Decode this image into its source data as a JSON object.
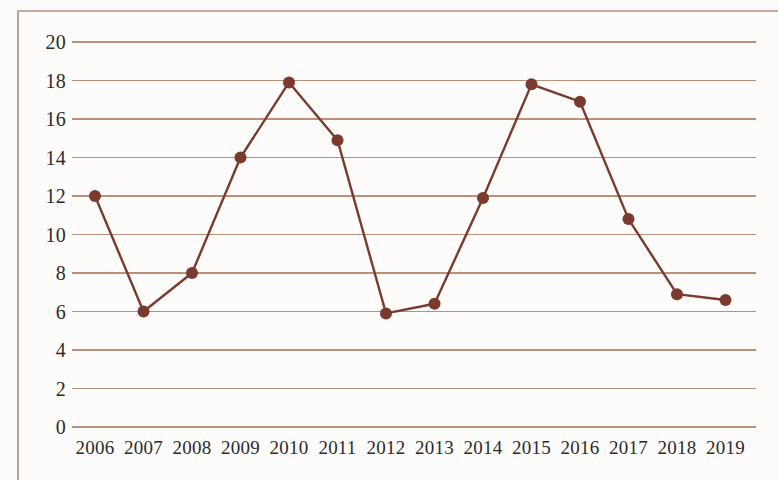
{
  "chart_data": {
    "type": "line",
    "title": "",
    "subtitle": "",
    "xlabel": "",
    "ylabel": "",
    "categories": [
      "2006",
      "2007",
      "2008",
      "2009",
      "2010",
      "2011",
      "2012",
      "2013",
      "2014",
      "2015",
      "2016",
      "2017",
      "2018",
      "2019"
    ],
    "x": [
      2006,
      2007,
      2008,
      2009,
      2010,
      2011,
      2012,
      2013,
      2014,
      2015,
      2016,
      2017,
      2018,
      2019
    ],
    "values": [
      12,
      6,
      8,
      14,
      17.9,
      14.9,
      5.9,
      6.4,
      11.9,
      17.8,
      16.9,
      10.8,
      6.9,
      6.6
    ],
    "series": [
      {
        "name": "",
        "values": [
          12,
          6,
          8,
          14,
          17.9,
          14.9,
          5.9,
          6.4,
          11.9,
          17.8,
          16.9,
          10.8,
          6.9,
          6.6
        ]
      }
    ],
    "ylim": [
      0,
      20
    ],
    "ytick_labels": [
      "0",
      "2",
      "4",
      "6",
      "8",
      "10",
      "12",
      "14",
      "16",
      "18",
      "20"
    ],
    "ytick_values": [
      0,
      2,
      4,
      6,
      8,
      10,
      12,
      14,
      16,
      18,
      20
    ],
    "grid": true,
    "grid_axis": "y",
    "legend": false,
    "legend_position": "none",
    "markers": true,
    "annotations": [],
    "colors": {
      "line": "#7a3b2e",
      "marker": "#7a3b2e",
      "gridline": "#b07b62",
      "background": "#fdfcfa",
      "tick_text": "#2b2b2b",
      "page_border": "#b9a49c"
    }
  },
  "layout": {
    "plot_left_px": 72,
    "plot_right_px": 756,
    "plot_top_px": 42,
    "plot_bottom_px": 427,
    "first_point_x_px": 95,
    "point_spacing_px": 48.5
  }
}
